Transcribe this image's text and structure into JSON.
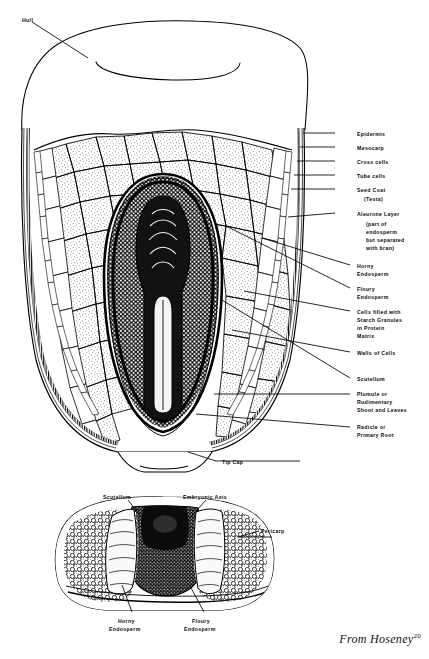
{
  "figure": {
    "credit_text": "From Hoseney",
    "credit_superscript": "20",
    "ink_color": "#000000",
    "paper_color": "#ffffff"
  },
  "longitudinal_section": {
    "name": "longitudinal-section",
    "labels": [
      {
        "id": "hull",
        "text": "Hull",
        "x": 22,
        "y": 17,
        "align": "left"
      },
      {
        "id": "epidermis",
        "text": "Epidermis",
        "x": 357,
        "y": 131,
        "align": "left"
      },
      {
        "id": "mesocarp",
        "text": "Mesocarp",
        "x": 357,
        "y": 145,
        "align": "left"
      },
      {
        "id": "cross-cells",
        "text": "Cross cells",
        "x": 357,
        "y": 159,
        "align": "left"
      },
      {
        "id": "tube-cells",
        "text": "Tube cells",
        "x": 357,
        "y": 173,
        "align": "left"
      },
      {
        "id": "seed-coat",
        "text": "Seed Coat",
        "x": 357,
        "y": 187,
        "align": "left"
      },
      {
        "id": "seed-coat-testa",
        "text": "(Testa)",
        "x": 364,
        "y": 196,
        "align": "left"
      },
      {
        "id": "aleurone-layer",
        "text": "Aleurone Layer",
        "x": 357,
        "y": 211,
        "align": "left"
      },
      {
        "id": "aleurone-note-1",
        "text": "(part of",
        "x": 366,
        "y": 221,
        "align": "left"
      },
      {
        "id": "aleurone-note-2",
        "text": "endosperm",
        "x": 366,
        "y": 229,
        "align": "left"
      },
      {
        "id": "aleurone-note-3",
        "text": "but separated",
        "x": 366,
        "y": 237,
        "align": "left"
      },
      {
        "id": "aleurone-note-4",
        "text": "with bran)",
        "x": 366,
        "y": 245,
        "align": "left"
      },
      {
        "id": "horny-endosperm",
        "text": "Horny",
        "x": 357,
        "y": 263,
        "align": "left"
      },
      {
        "id": "horny-endosperm-2",
        "text": "Endosperm",
        "x": 357,
        "y": 271,
        "align": "left"
      },
      {
        "id": "floury-endosperm",
        "text": "Floury",
        "x": 357,
        "y": 286,
        "align": "left"
      },
      {
        "id": "floury-endosperm-2",
        "text": "Endosperm",
        "x": 357,
        "y": 294,
        "align": "left"
      },
      {
        "id": "starch-granules-1",
        "text": "Cells filled with",
        "x": 357,
        "y": 309,
        "align": "left"
      },
      {
        "id": "starch-granules-2",
        "text": "Starch Granules",
        "x": 357,
        "y": 317,
        "align": "left"
      },
      {
        "id": "starch-granules-3",
        "text": "in Protein",
        "x": 357,
        "y": 325,
        "align": "left"
      },
      {
        "id": "starch-granules-4",
        "text": "Matrix",
        "x": 357,
        "y": 333,
        "align": "left"
      },
      {
        "id": "walls-of-cells",
        "text": "Walls of Cells",
        "x": 357,
        "y": 350,
        "align": "left"
      },
      {
        "id": "scutellum",
        "text": "Scutellum",
        "x": 357,
        "y": 376,
        "align": "left"
      },
      {
        "id": "plumule-1",
        "text": "Plumule or",
        "x": 357,
        "y": 391,
        "align": "left"
      },
      {
        "id": "plumule-2",
        "text": "Rudimentary",
        "x": 357,
        "y": 399,
        "align": "left"
      },
      {
        "id": "plumule-3",
        "text": "Shoot and Leaves",
        "x": 357,
        "y": 407,
        "align": "left"
      },
      {
        "id": "radicle-1",
        "text": "Radicle or",
        "x": 357,
        "y": 424,
        "align": "left"
      },
      {
        "id": "radicle-2",
        "text": "Primary Root",
        "x": 357,
        "y": 432,
        "align": "left"
      },
      {
        "id": "tip-cap",
        "text": "Tip Cap",
        "x": 222,
        "y": 459,
        "align": "left"
      }
    ]
  },
  "cross_section": {
    "name": "transverse-cross-section",
    "labels": [
      {
        "id": "scutellum-cs",
        "text": "Scutellum",
        "x": 103,
        "y": 494,
        "align": "left"
      },
      {
        "id": "embryonic-axis",
        "text": "Embryonic Axis",
        "x": 183,
        "y": 494,
        "align": "left"
      },
      {
        "id": "pericarp",
        "text": "Pericarp",
        "x": 261,
        "y": 528,
        "align": "left"
      },
      {
        "id": "horny-endosperm-cs-1",
        "text": "Horny",
        "x": 118,
        "y": 618,
        "align": "left"
      },
      {
        "id": "horny-endosperm-cs-2",
        "text": "Endosperm",
        "x": 109,
        "y": 626,
        "align": "left"
      },
      {
        "id": "floury-endosperm-cs-1",
        "text": "Floury",
        "x": 192,
        "y": 618,
        "align": "left"
      },
      {
        "id": "floury-endosperm-cs-2",
        "text": "Endosperm",
        "x": 184,
        "y": 626,
        "align": "left"
      }
    ]
  }
}
